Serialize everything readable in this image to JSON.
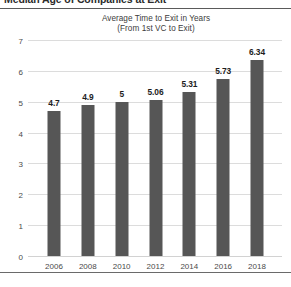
{
  "document": {
    "clipped_heading_text": "Median Age of Companies at Exit"
  },
  "chart_data": {
    "type": "bar",
    "title": "Average Time to Exit in Years",
    "subtitle": "(From 1st VC to Exit)",
    "xlabel": "",
    "ylabel": "",
    "categories": [
      "2006",
      "2008",
      "2010",
      "2012",
      "2014",
      "2016",
      "2018"
    ],
    "values": [
      4.7,
      4.9,
      5,
      5.06,
      5.31,
      5.73,
      6.34
    ],
    "value_labels": [
      "4.7",
      "4.9",
      "5",
      "5.06",
      "5.31",
      "5.73",
      "6.34"
    ],
    "ylim": [
      0,
      7
    ],
    "yticks": [
      0,
      1,
      2,
      3,
      4,
      5,
      6,
      7
    ],
    "ytick_labels": [
      "0",
      "1",
      "2",
      "3",
      "4",
      "5",
      "6",
      "7"
    ],
    "grid": true,
    "legend": null,
    "bar_color": "#565656",
    "gridline_color": "#dcdcdc",
    "background_color": "#ffffff",
    "label_color": "#1d1d1d"
  }
}
